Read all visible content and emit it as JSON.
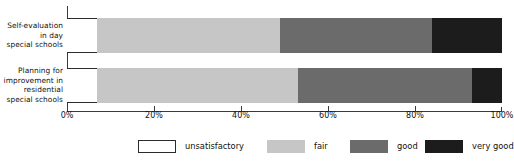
{
  "chart_data": {
    "type": "bar",
    "orientation": "horizontal",
    "stacked": true,
    "stack_total": 100,
    "title": "",
    "subtitle": "",
    "xlabel": "",
    "ylabel": "",
    "xlim": [
      0,
      100
    ],
    "grid": false,
    "legend_position": "bottom",
    "categories": [
      "Self-evaluation in day special schools",
      "Planning for improvement in residential special schools"
    ],
    "category_lines": [
      [
        "Self-evaluation",
        "in day",
        "special schools"
      ],
      [
        "Planning for",
        "improvement in",
        "residential",
        "special schools"
      ]
    ],
    "series": [
      {
        "name": "unsatisfactory",
        "color": "#ffffff",
        "values": [
          7,
          7
        ]
      },
      {
        "name": "fair",
        "color": "#c6c6c6",
        "values": [
          42,
          46
        ]
      },
      {
        "name": "good",
        "color": "#6b6b6b",
        "values": [
          35,
          40
        ]
      },
      {
        "name": "very good",
        "color": "#1c1c1c",
        "values": [
          16,
          7
        ]
      }
    ],
    "tick_values": [
      0,
      20,
      40,
      60,
      80,
      100
    ],
    "tick_labels": [
      "0%",
      "20%",
      "40%",
      "60%",
      "80%",
      "100%"
    ],
    "legend": [
      {
        "label": "unsatisfactory",
        "color": "#ffffff"
      },
      {
        "label": "fair",
        "color": "#c6c6c6"
      },
      {
        "label": "good",
        "color": "#6b6b6b"
      },
      {
        "label": "very good",
        "color": "#1c1c1c"
      }
    ],
    "axis_color": "#3a3a3a"
  }
}
